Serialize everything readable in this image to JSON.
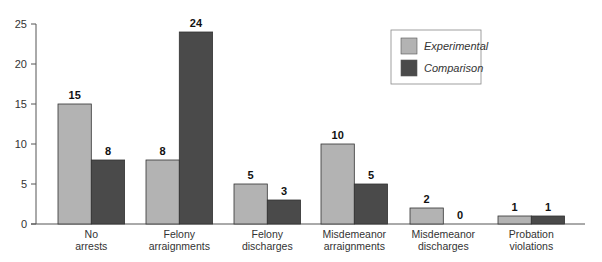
{
  "chart_data": {
    "type": "bar",
    "title": "",
    "xlabel": "",
    "ylabel": "",
    "ylim": [
      0,
      25
    ],
    "yticks": [
      0,
      5,
      10,
      15,
      20,
      25
    ],
    "grid": false,
    "legend_position": "top-right",
    "categories": [
      [
        "No",
        "arrests"
      ],
      [
        "Felony",
        "arraignments"
      ],
      [
        "Felony",
        "discharges"
      ],
      [
        "Misdemeanor",
        "arraignments"
      ],
      [
        "Misdemeanor",
        "discharges"
      ],
      [
        "Probation",
        "violations"
      ]
    ],
    "series": [
      {
        "name": "Experimental",
        "color": "#b3b3b3",
        "values": [
          15,
          8,
          5,
          10,
          2,
          1
        ]
      },
      {
        "name": "Comparison",
        "color": "#4a4a4a",
        "values": [
          8,
          24,
          3,
          5,
          0,
          1
        ]
      }
    ]
  }
}
